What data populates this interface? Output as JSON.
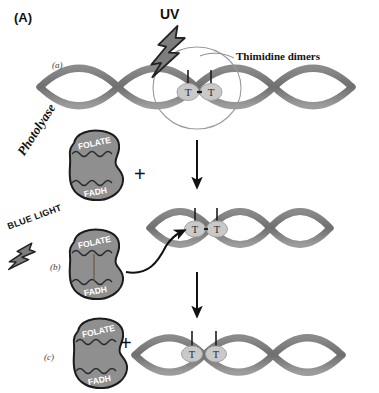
{
  "figure": {
    "panel_letter": "(A)",
    "title_hidden": "Photoreactivation repair of thymidine dimers by photolyase"
  },
  "labels": {
    "uv": "UV",
    "thimidine_dimers": "Thimidine dimers",
    "photolyase": "Photolyase",
    "blue_light": "BLUE LIGHT",
    "plus": "+",
    "step_a": "(a)",
    "step_b": "(b)",
    "step_c": "(c)"
  },
  "enzyme": {
    "domain_top": "FOLATE",
    "domain_bottom": "FADH",
    "fill": "#8f8f8f",
    "stroke": "#1c1c1c",
    "text_color": "#ffffff"
  },
  "dna": {
    "base_letter": "T",
    "strand_color": "#7b7b7b",
    "base_circle_fill": "#c9c9c9",
    "base_circle_stroke": "#9a9a9a"
  },
  "steps": [
    {
      "id": "a",
      "label": "(a)",
      "description": "UV strikes DNA and creates a thimidine dimer",
      "dimer_bonded": true,
      "highlight_circle": true
    },
    {
      "id": "b",
      "label": "(b)",
      "description": "Photolyase binds the dimer and absorbs blue light",
      "dimer_bonded": true,
      "highlight_circle": false
    },
    {
      "id": "c",
      "label": "(c)",
      "description": "Dimer is split; photolyase is released and DNA repaired",
      "dimer_bonded": false,
      "highlight_circle": false
    }
  ],
  "colors": {
    "lightning_fill": "#7d7d7d",
    "lightning_stroke": "#222222",
    "arrow": "#111111",
    "circle_outline": "#9b9b9b",
    "background": "#ffffff"
  }
}
